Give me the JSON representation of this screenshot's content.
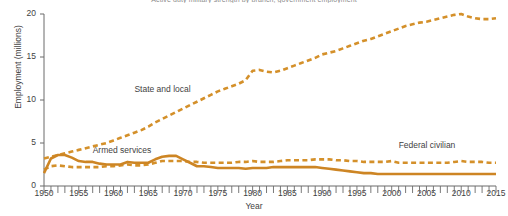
{
  "chart_data": {
    "type": "line",
    "title": "Active duty military strength by branch, government employment",
    "title_clipped": true,
    "xlabel": "Year",
    "ylabel": "Employment (millions)",
    "xlim": [
      1950,
      2015
    ],
    "ylim": [
      0,
      20
    ],
    "yticks": [
      0,
      5,
      10,
      15,
      20
    ],
    "xticks": [
      1950,
      1955,
      1960,
      1965,
      1970,
      1975,
      1980,
      1985,
      1990,
      1995,
      2000,
      2005,
      2010,
      2015
    ],
    "x_minor_tick_interval": 1,
    "grid": false,
    "legend_position": "inline-annotations",
    "accent_color": "#D4902A",
    "axis_color": "#6b6b6b",
    "background": "#ffffff",
    "series": [
      {
        "name": "State and local",
        "style": "dashed",
        "color": "#D4902A",
        "label_x": 1963,
        "label_y": 11.2,
        "x": [
          1950,
          1951,
          1952,
          1953,
          1954,
          1955,
          1956,
          1957,
          1958,
          1959,
          1960,
          1961,
          1962,
          1963,
          1964,
          1965,
          1966,
          1967,
          1968,
          1969,
          1970,
          1971,
          1972,
          1973,
          1974,
          1975,
          1976,
          1977,
          1978,
          1979,
          1980,
          1981,
          1982,
          1983,
          1984,
          1985,
          1986,
          1987,
          1988,
          1989,
          1990,
          1991,
          1992,
          1993,
          1994,
          1995,
          1996,
          1997,
          1998,
          1999,
          2000,
          2001,
          2002,
          2003,
          2004,
          2005,
          2006,
          2007,
          2008,
          2009,
          2010,
          2011,
          2012,
          2013,
          2014,
          2015
        ],
        "values": [
          3.2,
          3.4,
          3.6,
          3.8,
          4.0,
          4.2,
          4.4,
          4.6,
          4.8,
          5.0,
          5.3,
          5.6,
          5.9,
          6.2,
          6.5,
          6.9,
          7.4,
          7.8,
          8.2,
          8.6,
          9.0,
          9.4,
          9.8,
          10.2,
          10.6,
          11.0,
          11.3,
          11.6,
          11.9,
          12.3,
          13.4,
          13.5,
          13.3,
          13.2,
          13.4,
          13.7,
          14.0,
          14.3,
          14.6,
          14.9,
          15.3,
          15.5,
          15.7,
          16.0,
          16.3,
          16.6,
          16.9,
          17.1,
          17.4,
          17.7,
          18.0,
          18.3,
          18.6,
          18.8,
          19.0,
          19.1,
          19.3,
          19.5,
          19.7,
          19.9,
          20.0,
          19.7,
          19.5,
          19.4,
          19.4,
          19.5
        ]
      },
      {
        "name": "Federal civilian",
        "style": "dashed",
        "color": "#D4902A",
        "label_x": 2001,
        "label_y": 4.6,
        "x": [
          1950,
          1951,
          1952,
          1953,
          1954,
          1955,
          1956,
          1957,
          1958,
          1959,
          1960,
          1961,
          1962,
          1963,
          1964,
          1965,
          1966,
          1967,
          1968,
          1969,
          1970,
          1971,
          1972,
          1973,
          1974,
          1975,
          1976,
          1977,
          1978,
          1979,
          1980,
          1981,
          1982,
          1983,
          1984,
          1985,
          1986,
          1987,
          1988,
          1989,
          1990,
          1991,
          1992,
          1993,
          1994,
          1995,
          1996,
          1997,
          1998,
          1999,
          2000,
          2001,
          2002,
          2003,
          2004,
          2005,
          2006,
          2007,
          2008,
          2009,
          2010,
          2011,
          2012,
          2013,
          2014,
          2015
        ],
        "values": [
          1.9,
          2.3,
          2.4,
          2.3,
          2.2,
          2.2,
          2.2,
          2.2,
          2.2,
          2.3,
          2.3,
          2.4,
          2.5,
          2.4,
          2.4,
          2.5,
          2.7,
          2.9,
          2.9,
          2.9,
          2.9,
          2.8,
          2.8,
          2.7,
          2.7,
          2.7,
          2.7,
          2.7,
          2.8,
          2.8,
          2.9,
          2.8,
          2.8,
          2.8,
          2.9,
          3.0,
          3.0,
          3.0,
          3.0,
          3.1,
          3.1,
          3.1,
          3.0,
          3.0,
          2.9,
          2.9,
          2.8,
          2.8,
          2.8,
          2.8,
          2.9,
          2.7,
          2.7,
          2.7,
          2.7,
          2.7,
          2.7,
          2.7,
          2.7,
          2.8,
          2.9,
          2.8,
          2.8,
          2.8,
          2.7,
          2.7
        ]
      },
      {
        "name": "Armed services",
        "style": "solid",
        "color": "#CD8524",
        "label_x": 1957,
        "label_y": 4.1,
        "x": [
          1950,
          1951,
          1952,
          1953,
          1954,
          1955,
          1956,
          1957,
          1958,
          1959,
          1960,
          1961,
          1962,
          1963,
          1964,
          1965,
          1966,
          1967,
          1968,
          1969,
          1970,
          1971,
          1972,
          1973,
          1974,
          1975,
          1976,
          1977,
          1978,
          1979,
          1980,
          1981,
          1982,
          1983,
          1984,
          1985,
          1986,
          1987,
          1988,
          1989,
          1990,
          1991,
          1992,
          1993,
          1994,
          1995,
          1996,
          1997,
          1998,
          1999,
          2000,
          2001,
          2002,
          2003,
          2004,
          2005,
          2006,
          2007,
          2008,
          2009,
          2010,
          2011,
          2012,
          2013,
          2014,
          2015
        ],
        "values": [
          1.5,
          3.2,
          3.6,
          3.6,
          3.3,
          2.9,
          2.8,
          2.8,
          2.6,
          2.5,
          2.5,
          2.5,
          2.8,
          2.7,
          2.7,
          2.7,
          3.1,
          3.4,
          3.5,
          3.5,
          3.1,
          2.7,
          2.3,
          2.3,
          2.2,
          2.1,
          2.1,
          2.1,
          2.1,
          2.0,
          2.1,
          2.1,
          2.1,
          2.2,
          2.2,
          2.2,
          2.2,
          2.2,
          2.2,
          2.2,
          2.1,
          2.0,
          1.9,
          1.8,
          1.7,
          1.6,
          1.5,
          1.5,
          1.4,
          1.4,
          1.4,
          1.4,
          1.4,
          1.4,
          1.4,
          1.4,
          1.4,
          1.4,
          1.4,
          1.4,
          1.4,
          1.4,
          1.4,
          1.4,
          1.4,
          1.4
        ]
      }
    ]
  }
}
